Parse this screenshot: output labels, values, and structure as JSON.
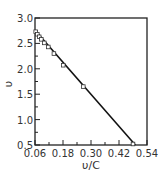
{
  "chart_data": {
    "type": "line",
    "title": "",
    "xlabel": "υ/C",
    "ylabel": "υ",
    "xlim": [
      0.06,
      0.54
    ],
    "ylim": [
      0.5,
      3.0
    ],
    "xticks": [
      "0.06",
      "0.18",
      "0.30",
      "0.42",
      "0.54"
    ],
    "yticks": [
      "0.5",
      "1.0",
      "1.5",
      "2.0",
      "2.5",
      "3.0"
    ],
    "grid": false,
    "legend": null,
    "series": [
      {
        "name": "data",
        "marker": "square-open",
        "line": "solid",
        "x": [
          0.063,
          0.07,
          0.078,
          0.087,
          0.1,
          0.117,
          0.141,
          0.181,
          0.267,
          0.48
        ],
        "y": [
          2.73,
          2.68,
          2.63,
          2.58,
          2.51,
          2.43,
          2.3,
          2.07,
          1.65,
          0.52
        ]
      }
    ],
    "fit_line": {
      "x": [
        0.06,
        0.49
      ],
      "y": [
        2.76,
        0.5
      ]
    }
  },
  "colors": {
    "axis": "#222222",
    "line": "#111111",
    "marker": "#333333"
  }
}
